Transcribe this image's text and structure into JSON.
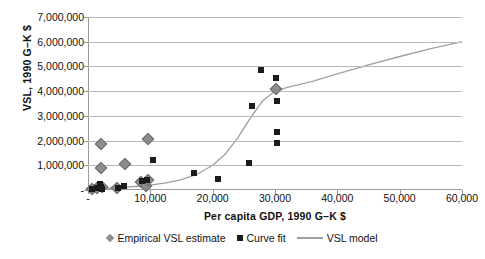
{
  "chart_data": {
    "type": "scatter",
    "title": "",
    "xlabel": "Per capita GDP, 1990 G–K $",
    "ylabel": "VSL, 1990 G–K $",
    "xlim": [
      0,
      60000
    ],
    "ylim": [
      0,
      7000000
    ],
    "grid": true,
    "legend_position": "bottom",
    "x_tick_labels": [
      "-",
      "10,000",
      "20,000",
      "30,000",
      "40,000",
      "50,000",
      "60,000"
    ],
    "x_tick_values": [
      0,
      10000,
      20000,
      30000,
      40000,
      50000,
      60000
    ],
    "y_tick_labels": [
      "-",
      "1,000,000",
      "2,000,000",
      "3,000,000",
      "4,000,000",
      "5,000,000",
      "6,000,000",
      "7,000,000"
    ],
    "y_tick_values": [
      0,
      1000000,
      2000000,
      3000000,
      4000000,
      5000000,
      6000000,
      7000000
    ],
    "series": [
      {
        "name": "Empirical VSL estimate",
        "marker": "diamond",
        "color": "#8c8c8c",
        "points": [
          [
            700,
            60000
          ],
          [
            1500,
            90000
          ],
          [
            2100,
            1880000
          ],
          [
            2100,
            890000
          ],
          [
            2300,
            120000
          ],
          [
            4700,
            70000
          ],
          [
            6000,
            1070000
          ],
          [
            8500,
            330000
          ],
          [
            9300,
            180000
          ],
          [
            9600,
            2050000
          ],
          [
            9700,
            390000
          ],
          [
            30200,
            4100000
          ]
        ]
      },
      {
        "name": "Curve fit",
        "marker": "square",
        "color": "#1b1b1b",
        "points": [
          [
            600,
            50000
          ],
          [
            1400,
            90000
          ],
          [
            2000,
            250000
          ],
          [
            2100,
            110000
          ],
          [
            2200,
            60000
          ],
          [
            4800,
            90000
          ],
          [
            5800,
            170000
          ],
          [
            8600,
            370000
          ],
          [
            9500,
            400000
          ],
          [
            10500,
            1200000
          ],
          [
            17000,
            680000
          ],
          [
            20800,
            460000
          ],
          [
            25800,
            1100000
          ],
          [
            26300,
            3400000
          ],
          [
            27800,
            4850000
          ],
          [
            30200,
            4550000
          ],
          [
            30300,
            3620000
          ],
          [
            30300,
            2330000
          ],
          [
            30300,
            1900000
          ]
        ]
      },
      {
        "name": "VSL model",
        "marker": "line",
        "color": "#a0a0a0",
        "points": [
          [
            0,
            30000
          ],
          [
            2500,
            60000
          ],
          [
            5000,
            95000
          ],
          [
            7500,
            140000
          ],
          [
            10000,
            200000
          ],
          [
            12500,
            290000
          ],
          [
            15000,
            420000
          ],
          [
            17500,
            640000
          ],
          [
            20000,
            1000000
          ],
          [
            22000,
            1450000
          ],
          [
            24000,
            2100000
          ],
          [
            26000,
            2900000
          ],
          [
            28000,
            3600000
          ],
          [
            30000,
            4000000
          ],
          [
            32000,
            4150000
          ],
          [
            36000,
            4400000
          ],
          [
            40000,
            4700000
          ],
          [
            45000,
            5060000
          ],
          [
            50000,
            5400000
          ],
          [
            55000,
            5720000
          ],
          [
            60000,
            6000000
          ]
        ]
      }
    ]
  },
  "legend": {
    "items": [
      {
        "label": "Empirical VSL estimate"
      },
      {
        "label": "Curve fit"
      },
      {
        "label": "VSL model"
      }
    ]
  }
}
